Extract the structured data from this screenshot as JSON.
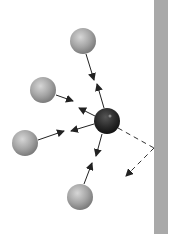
{
  "diagram": {
    "colors": {
      "wall": "#a8a8a8",
      "central_particle": "#2a2a2a",
      "particle": "#a0a0a0",
      "arrow": "#222222"
    },
    "central_particle": {
      "x": 107,
      "y": 121,
      "r": 13
    },
    "particles": [
      {
        "x": 83,
        "y": 41,
        "r": 13
      },
      {
        "x": 43,
        "y": 90,
        "r": 13
      },
      {
        "x": 25,
        "y": 143,
        "r": 13
      },
      {
        "x": 80,
        "y": 197,
        "r": 13
      }
    ],
    "wall": {
      "x": 154,
      "width": 14
    }
  }
}
